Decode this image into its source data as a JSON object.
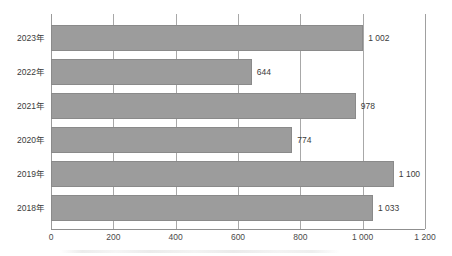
{
  "chart_data": {
    "type": "bar",
    "orientation": "horizontal",
    "title": "",
    "subtitle": "",
    "xlabel": "",
    "ylabel": "",
    "categories": [
      "2023年",
      "2022年",
      "2021年",
      "2020年",
      "2019年",
      "2018年"
    ],
    "values": [
      1002,
      644,
      978,
      774,
      1100,
      1033
    ],
    "value_labels": [
      "1 002",
      "644",
      "978",
      "774",
      "1 100",
      "1 033"
    ],
    "xlim": [
      0,
      1200
    ],
    "xticks": [
      0,
      200,
      400,
      600,
      800,
      1000,
      1200
    ],
    "xtick_labels": [
      "0",
      "200",
      "400",
      "600",
      "800",
      "1 000",
      "1 200"
    ],
    "grid": true,
    "grid_axis": "x",
    "legend": null,
    "legend_position": "none",
    "bar_color": "#9c9c9c",
    "bar_border_color": "#8a8a8a",
    "gridline_color": "#a8a8a8",
    "axis_color": "#8f8f8f",
    "text_color": "#3b3b3b",
    "background_color": "#ffffff"
  },
  "axis": {
    "zero_label": "0",
    "max_label": "1 200"
  }
}
